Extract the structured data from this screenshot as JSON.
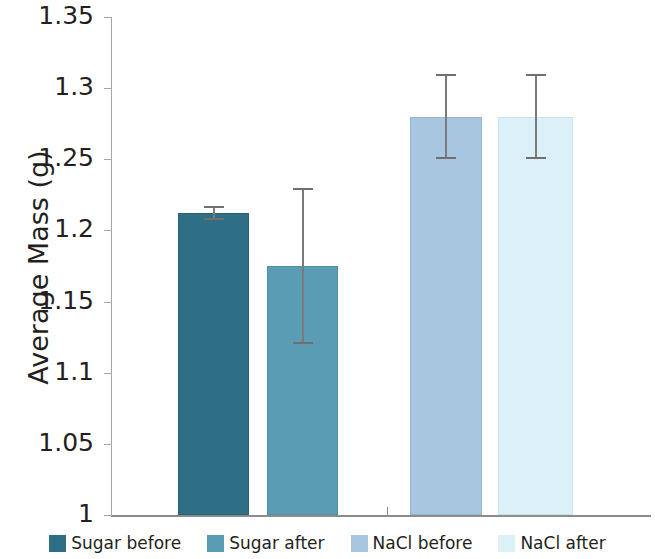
{
  "chart_data": {
    "type": "bar",
    "title": "",
    "xlabel": "",
    "ylabel": "Average Mass (g)",
    "ylim": [
      1,
      1.35
    ],
    "ytick_labels": [
      "1.35",
      "1.3",
      "1.25",
      "1.2",
      "1.15",
      "1.1",
      "1.05",
      "1"
    ],
    "ytick_values": [
      1.35,
      1.3,
      1.25,
      1.2,
      1.15,
      1.1,
      1.05,
      1
    ],
    "ytick_interval": 0.05,
    "grid": false,
    "legend_position": "bottom",
    "categories": [
      "Sugar before",
      "Sugar after",
      "NaCl before",
      "NaCl after"
    ],
    "values": [
      1.212,
      1.175,
      1.28,
      1.28
    ],
    "errors": [
      0.005,
      0.055,
      0.03,
      0.03
    ],
    "error_low": [
      1.207,
      1.12,
      1.25,
      1.25
    ],
    "error_high": [
      1.217,
      1.23,
      1.31,
      1.31
    ],
    "colors": [
      "#2e6f86",
      "#5b9cb5",
      "#a9c6e0",
      "#dcf0f7"
    ],
    "series": [
      {
        "name": "Sugar before",
        "value": 1.212,
        "error": 0.005,
        "color": "#2e6f86"
      },
      {
        "name": "Sugar after",
        "value": 1.175,
        "error": 0.055,
        "color": "#5b9cb5"
      },
      {
        "name": "NaCl before",
        "value": 1.28,
        "error": 0.03,
        "color": "#a9c6e0"
      },
      {
        "name": "NaCl after",
        "value": 1.28,
        "error": 0.03,
        "color": "#dcf0f7"
      }
    ]
  },
  "axis": {
    "y_title": "Average Mass (g)",
    "ticks": [
      {
        "label": "1.35",
        "value": 1.35
      },
      {
        "label": "1.3",
        "value": 1.3
      },
      {
        "label": "1.25",
        "value": 1.25
      },
      {
        "label": "1.2",
        "value": 1.2
      },
      {
        "label": "1.15",
        "value": 1.15
      },
      {
        "label": "1.1",
        "value": 1.1
      },
      {
        "label": "1.05",
        "value": 1.05
      },
      {
        "label": "1",
        "value": 1
      }
    ]
  },
  "legend": {
    "items": [
      {
        "label": "Sugar before",
        "color": "#2e6f86"
      },
      {
        "label": "Sugar after",
        "color": "#5b9cb5"
      },
      {
        "label": "NaCl before",
        "color": "#a9c6e0"
      },
      {
        "label": "NaCl after",
        "color": "#dcf0f7"
      }
    ]
  }
}
